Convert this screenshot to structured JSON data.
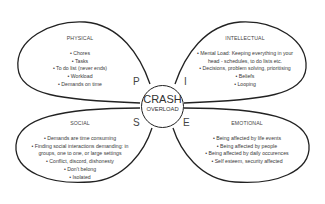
{
  "diagram": {
    "center": {
      "line1": "CRASH",
      "line2": "OVERLOAD"
    },
    "letters": {
      "p": "P",
      "i": "I",
      "s": "S",
      "e": "E"
    },
    "petals": {
      "physical": {
        "title": "PHYSICAL",
        "items": [
          "• Chores",
          "• Tasks",
          "• To do list (never ends)",
          "• Workload",
          "• Demands on time"
        ]
      },
      "intellectual": {
        "title": "INTELLECTUAL",
        "items": [
          "• Mental Load:  Keeping everything in your",
          "head - schedules, to do lists etc.",
          "• Decisions, problem solving, prioritising",
          "• Beliefs",
          "• Looping"
        ]
      },
      "social": {
        "title": "SOCIAL",
        "items": [
          "• Demands are time consuming",
          "• Finding social interactions demanding: in",
          "groups, one to one, or large settings",
          "• Conflict, discord, dishonesty",
          "• Don't belong",
          "• Isolated"
        ]
      },
      "emotional": {
        "title": "EMOTIONAL",
        "items": [
          "• Being affected by life events",
          "• Being affected by people",
          "• Being affected by daily occurences",
          "• Self esteem, security affected"
        ]
      }
    },
    "colors": {
      "stroke": "#222222",
      "text": "#3a3a3a",
      "background": "#ffffff"
    }
  }
}
